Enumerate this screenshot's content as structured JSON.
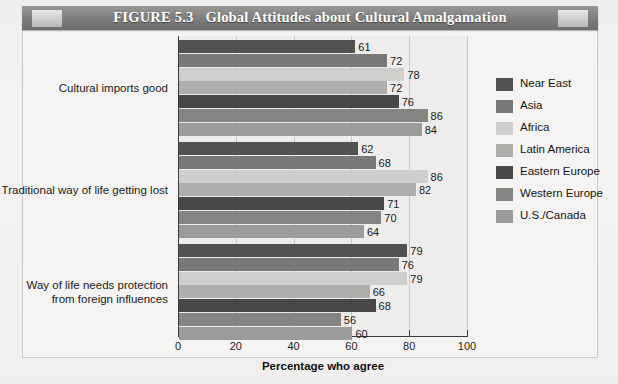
{
  "figure": {
    "number_label": "FIGURE 5.3",
    "title": "Global Attitudes about Cultural Amalgamation"
  },
  "chart_data": {
    "type": "bar",
    "orientation": "horizontal",
    "title": "Global Attitudes about Cultural Amalgamation",
    "subtitle": "",
    "xlabel": "Percentage who agree",
    "ylabel": "",
    "xlim": [
      0,
      100
    ],
    "xticks": [
      0,
      20,
      40,
      60,
      80,
      100
    ],
    "xtick_labels": [
      "0",
      "20",
      "40",
      "60",
      "80",
      "100"
    ],
    "grid": true,
    "grid_axis": "x",
    "legend_position": "right",
    "categories": [
      "Cultural imports good",
      "Traditional way of life getting lost",
      "Way of life needs protection from foreign influences"
    ],
    "category_lines": [
      [
        "Cultural imports good"
      ],
      [
        "Traditional way of life getting lost"
      ],
      [
        "Way of life needs protection",
        "from foreign influences"
      ]
    ],
    "series": [
      {
        "name": "Near East",
        "color": "#545251",
        "values": [
          61,
          62,
          79
        ]
      },
      {
        "name": "Asia",
        "color": "#7b7977",
        "values": [
          72,
          68,
          76
        ]
      },
      {
        "name": "Africa",
        "color": "#cfcecb",
        "values": [
          78,
          86,
          79
        ]
      },
      {
        "name": "Latin America",
        "color": "#b0aeab",
        "values": [
          72,
          82,
          66
        ]
      },
      {
        "name": "Eastern Europe",
        "color": "#4a4847",
        "values": [
          76,
          71,
          68
        ]
      },
      {
        "name": "Western Europe",
        "color": "#86847f",
        "values": [
          86,
          70,
          56
        ]
      },
      {
        "name": "U.S./Canada",
        "color": "#9d9b97",
        "values": [
          84,
          64,
          60
        ]
      }
    ]
  }
}
